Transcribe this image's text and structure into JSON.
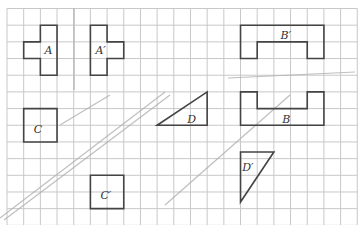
{
  "grid": {
    "origin_x": 7,
    "origin_y": 8.5,
    "cell": 16.68,
    "cols": 21,
    "rows": 13,
    "line_color": "#c8c8c8",
    "shape_color": "#444444"
  },
  "shapes": [
    {
      "id": "A",
      "label": "A",
      "points": [
        [
          2,
          1
        ],
        [
          3,
          1
        ],
        [
          3,
          4
        ],
        [
          2,
          4
        ],
        [
          2,
          3
        ],
        [
          1,
          3
        ],
        [
          1,
          2
        ],
        [
          2,
          2
        ]
      ],
      "label_at": [
        2.25,
        2.5
      ]
    },
    {
      "id": "A-prime",
      "label": "A′",
      "points": [
        [
          5,
          1
        ],
        [
          6,
          1
        ],
        [
          6,
          2
        ],
        [
          7,
          2
        ],
        [
          7,
          3
        ],
        [
          6,
          3
        ],
        [
          6,
          4
        ],
        [
          5,
          4
        ]
      ],
      "label_at": [
        5.3,
        2.5
      ]
    },
    {
      "id": "B-prime",
      "label": "B′",
      "points": [
        [
          14,
          1
        ],
        [
          19,
          1
        ],
        [
          19,
          3
        ],
        [
          18,
          3
        ],
        [
          18,
          2
        ],
        [
          15,
          2
        ],
        [
          15,
          3
        ],
        [
          14,
          3
        ]
      ],
      "label_at": [
        16.4,
        1.6
      ]
    },
    {
      "id": "B",
      "label": "B",
      "points": [
        [
          14,
          5
        ],
        [
          15,
          5
        ],
        [
          15,
          6
        ],
        [
          18,
          6
        ],
        [
          18,
          5
        ],
        [
          19,
          5
        ],
        [
          19,
          7
        ],
        [
          14,
          7
        ]
      ],
      "label_at": [
        16.5,
        6.6
      ]
    },
    {
      "id": "C",
      "label": "C",
      "points": [
        [
          1,
          6
        ],
        [
          3,
          6
        ],
        [
          3,
          8
        ],
        [
          1,
          8
        ]
      ],
      "label_at": [
        1.6,
        7.2
      ]
    },
    {
      "id": "C-prime",
      "label": "C′",
      "points": [
        [
          5,
          10
        ],
        [
          7,
          10
        ],
        [
          7,
          12
        ],
        [
          5,
          12
        ]
      ],
      "label_at": [
        5.6,
        11.2
      ]
    },
    {
      "id": "D",
      "label": "D",
      "points": [
        [
          9,
          7
        ],
        [
          12,
          5
        ],
        [
          12,
          7
        ]
      ],
      "label_at": [
        10.8,
        6.6
      ]
    },
    {
      "id": "D-prime",
      "label": "D′",
      "points": [
        [
          14,
          8.6
        ],
        [
          16,
          8.6
        ],
        [
          14,
          11.6
        ]
      ],
      "label_at": [
        14.1,
        9.5
      ]
    }
  ],
  "pencil_lines": [
    [
      [
        0,
        218
      ],
      [
        165,
        92
      ]
    ],
    [
      [
        4,
        220
      ],
      [
        170,
        95
      ]
    ],
    [
      [
        228,
        78
      ],
      [
        355,
        72
      ]
    ],
    [
      [
        165,
        205
      ],
      [
        290,
        95
      ]
    ],
    [
      [
        60,
        125
      ],
      [
        110,
        95
      ]
    ]
  ]
}
